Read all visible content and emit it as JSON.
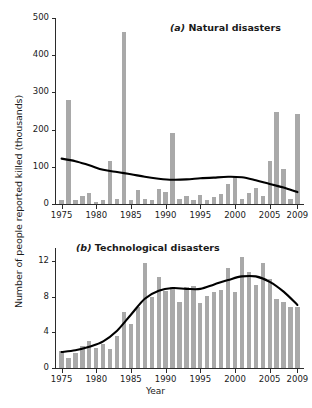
{
  "figure": {
    "ylabel": "Number of people reported killed (thousands)",
    "xlabel": "Year",
    "bar_color": "#a9a9a9",
    "trend_color": "#000000"
  },
  "chart_data": [
    {
      "type": "bar",
      "title": "(a) Natural disasters",
      "title_prefix": "(a)",
      "title_text": "Natural disasters",
      "xlabel": "",
      "ylabel": "Number of people reported killed (thousands)",
      "xlim": [
        1974.2,
        2009.8
      ],
      "ylim": [
        0,
        500
      ],
      "yticks": [
        0,
        100,
        200,
        300,
        400,
        500
      ],
      "ytick_labels": [
        "0",
        "100",
        "200",
        "300",
        "400",
        "500"
      ],
      "xticks": [
        1975,
        1980,
        1985,
        1990,
        1995,
        2000,
        2005,
        2009
      ],
      "xtick_labels": [
        "1975",
        "1980",
        "1985",
        "1990",
        "1995",
        "2000",
        "2005",
        "2009"
      ],
      "grid": false,
      "legend": "none",
      "categories": [
        1975,
        1976,
        1977,
        1978,
        1979,
        1980,
        1981,
        1982,
        1983,
        1984,
        1985,
        1986,
        1987,
        1988,
        1989,
        1990,
        1991,
        1992,
        1993,
        1994,
        1995,
        1996,
        1997,
        1998,
        1999,
        2000,
        2001,
        2002,
        2003,
        2004,
        2005,
        2006,
        2007,
        2008,
        2009
      ],
      "values": [
        10,
        280,
        12,
        22,
        30,
        5,
        12,
        115,
        14,
        462,
        10,
        38,
        14,
        12,
        40,
        32,
        190,
        14,
        22,
        10,
        24,
        12,
        18,
        28,
        55,
        76,
        14,
        30,
        42,
        22,
        115,
        248,
        95,
        14,
        243
      ],
      "series": [
        {
          "name": "Reported killed (thousands)",
          "type": "bar",
          "values": [
            10,
            280,
            12,
            22,
            30,
            5,
            12,
            115,
            14,
            462,
            10,
            38,
            14,
            12,
            40,
            32,
            190,
            14,
            22,
            10,
            24,
            12,
            18,
            28,
            55,
            76,
            14,
            30,
            42,
            22,
            115,
            248,
            95,
            14,
            243
          ]
        },
        {
          "name": "Smoothed trend",
          "type": "line",
          "x": [
            1975,
            1977,
            1979,
            1981,
            1983,
            1985,
            1987,
            1989,
            1991,
            1993,
            1995,
            1997,
            1999,
            2001,
            2003,
            2005,
            2007,
            2009
          ],
          "values": [
            122,
            115,
            104,
            92,
            86,
            80,
            73,
            68,
            65,
            66,
            69,
            71,
            73,
            72,
            64,
            54,
            44,
            32
          ]
        }
      ]
    },
    {
      "type": "bar",
      "title": "(b) Technological disasters",
      "title_prefix": "(b)",
      "title_text": "Technological disasters",
      "xlabel": "Year",
      "ylabel": "Number of people reported killed (thousands)",
      "xlim": [
        1974.2,
        2009.8
      ],
      "ylim": [
        0,
        13.5
      ],
      "yticks": [
        0,
        4,
        8,
        12
      ],
      "ytick_labels": [
        "0",
        "4",
        "8",
        "12"
      ],
      "xticks": [
        1975,
        1980,
        1985,
        1990,
        1995,
        2000,
        2005,
        2009
      ],
      "xtick_labels": [
        "1975",
        "1980",
        "1985",
        "1990",
        "1995",
        "2000",
        "2005",
        "2009"
      ],
      "grid": false,
      "legend": "none",
      "categories": [
        1975,
        1976,
        1977,
        1978,
        1979,
        1980,
        1981,
        1982,
        1983,
        1984,
        1985,
        1986,
        1987,
        1988,
        1989,
        1990,
        1991,
        1992,
        1993,
        1994,
        1995,
        1996,
        1997,
        1998,
        1999,
        2000,
        2001,
        2002,
        2003,
        2004,
        2005,
        2006,
        2007,
        2008,
        2009
      ],
      "values": [
        1.9,
        1.1,
        1.7,
        2.5,
        3.0,
        2.3,
        2.7,
        2.1,
        3.6,
        6.3,
        5.0,
        6.9,
        11.8,
        8.0,
        10.2,
        8.7,
        9.1,
        7.4,
        9.1,
        9.2,
        7.3,
        8.1,
        8.6,
        8.8,
        11.3,
        8.6,
        12.5,
        10.8,
        9.3,
        11.8,
        10.0,
        7.8,
        7.4,
        6.9,
        6.9
      ],
      "series": [
        {
          "name": "Reported killed (thousands)",
          "type": "bar",
          "values": [
            1.9,
            1.1,
            1.7,
            2.5,
            3.0,
            2.3,
            2.7,
            2.1,
            3.6,
            6.3,
            5.0,
            6.9,
            11.8,
            8.0,
            10.2,
            8.7,
            9.1,
            7.4,
            9.1,
            9.2,
            7.3,
            8.1,
            8.6,
            8.8,
            11.3,
            8.6,
            12.5,
            10.8,
            9.3,
            11.8,
            10.0,
            7.8,
            7.4,
            6.9,
            6.9
          ]
        },
        {
          "name": "Smoothed trend",
          "type": "line",
          "x": [
            1975,
            1977,
            1979,
            1981,
            1983,
            1985,
            1987,
            1989,
            1991,
            1993,
            1995,
            1997,
            1999,
            2001,
            2003,
            2005,
            2007,
            2009
          ],
          "values": [
            1.8,
            2.0,
            2.4,
            3.0,
            4.2,
            6.0,
            7.8,
            8.7,
            9.0,
            8.9,
            8.9,
            9.4,
            9.9,
            10.3,
            10.3,
            9.7,
            8.6,
            7.1
          ]
        }
      ]
    }
  ]
}
